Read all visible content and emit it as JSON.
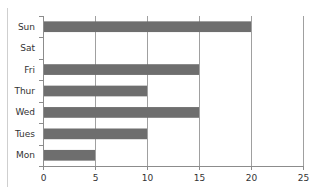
{
  "chart_data": {
    "type": "bar",
    "orientation": "horizontal",
    "title": "",
    "xlabel": "",
    "ylabel": "",
    "categories": [
      "Mon",
      "Tues",
      "Wed",
      "Thur",
      "Fri",
      "Sat",
      "Sun"
    ],
    "values": [
      5,
      10,
      15,
      10,
      15,
      0,
      20
    ],
    "xlim": [
      0,
      25
    ],
    "x_ticks": [
      0,
      5,
      10,
      15,
      20,
      25
    ],
    "x_tick_labels": [
      "0",
      "5",
      "10",
      "15",
      "20",
      "25"
    ],
    "grid": "vertical major gridlines",
    "legend": "none",
    "colors": {
      "bar": "#6e6e6e",
      "gridline": "#a0a0a0",
      "axis": "#8c8c8c",
      "text": "#333333"
    }
  }
}
